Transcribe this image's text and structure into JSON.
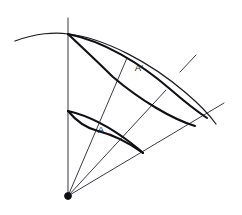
{
  "figure": {
    "title": "Curved sector with two corresponding area patches",
    "background_color": "#ffffff",
    "ink_color": "#101014",
    "width": 242,
    "height": 215,
    "labels": {
      "inner_patch": "A",
      "outer_patch": "A′"
    },
    "label_positions": {
      "inner_patch": {
        "x": 101,
        "y": 133
      },
      "outer_patch": {
        "x": 139,
        "y": 71
      }
    },
    "apex": {
      "x": 68,
      "y": 196,
      "marker": "filled-dot",
      "radius": 3.4
    },
    "rays": [
      {
        "name": "vertical-axis",
        "from": {
          "x": 68,
          "y": 196
        },
        "to": {
          "x": 68,
          "y": 18
        },
        "weight": "thin"
      },
      {
        "name": "ray-upper-middle",
        "from": {
          "x": 68,
          "y": 196
        },
        "to": {
          "x": 127,
          "y": 58
        },
        "weight": "thin"
      },
      {
        "name": "ray-lower-middle",
        "from": {
          "x": 68,
          "y": 196
        },
        "to": {
          "x": 166,
          "y": 90
        },
        "weight": "thin"
      },
      {
        "name": "ray-lower-boundary",
        "from": {
          "x": 68,
          "y": 196
        },
        "to": {
          "x": 224,
          "y": 103
        },
        "weight": "thin"
      },
      {
        "name": "ray-upper-boundary-short",
        "from": {
          "x": 180,
          "y": 72
        },
        "to": {
          "x": 196,
          "y": 55
        },
        "weight": "thin"
      }
    ],
    "arcs": [
      {
        "name": "outer-boundary-arc",
        "description": "long outer arc crossing the vertical axis at the top and sweeping to lower right",
        "weight": "arc",
        "path": "M 15,41 C 36,33 56,32 68,34 C 104,38 150,62 186,93 C 199,104 208,113 216,124"
      },
      {
        "name": "outer-patch-upper-arc",
        "description": "upper bounding arc of region A-prime running from top vertex to right vertex",
        "weight": "bold",
        "path": "M 68,34 C 103,41 140,63 170,89 C 185,102 198,112 207,118"
      },
      {
        "name": "outer-patch-lower-arc",
        "description": "lower bounding arc of region A-prime",
        "weight": "bold",
        "path": "M 68,34 C 85,50 99,63 113,77 C 140,100 172,119 195,126"
      },
      {
        "name": "inner-patch-upper-arc",
        "description": "upper bounding arc of region A",
        "weight": "bold",
        "path": "M 68,111 C 90,116 114,130 131,143 C 137,148 141,151 143,153"
      },
      {
        "name": "inner-patch-lower-arc",
        "description": "lower bounding arc of region A",
        "weight": "bold",
        "path": "M 68,111 C 77,122 86,128 98,131 C 114,135 132,145 143,153"
      }
    ],
    "vertices": [
      {
        "name": "top-vertex",
        "x": 68,
        "y": 34
      },
      {
        "name": "inner-axis-vertex",
        "x": 68,
        "y": 111
      },
      {
        "name": "inner-right-vertex",
        "x": 143,
        "y": 153
      },
      {
        "name": "inner-mid-vertex",
        "x": 98,
        "y": 131
      },
      {
        "name": "outer-mid-vertex",
        "x": 113,
        "y": 77
      },
      {
        "name": "outer-right-vertex",
        "x": 207,
        "y": 118
      }
    ]
  }
}
